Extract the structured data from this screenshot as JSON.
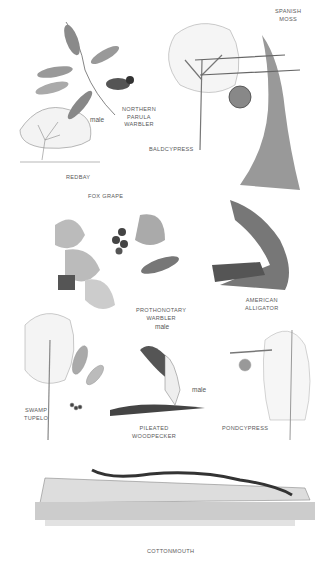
{
  "plate": {
    "labels": {
      "spanish_moss": [
        "SPANISH",
        "MOSS"
      ],
      "northern_parula": [
        "NORTHERN",
        "PARULA",
        "WARBLER"
      ],
      "northern_parula_sex": "male",
      "baldcypress": "BALDCYPRESS",
      "redbay": "REDBAY",
      "fox_grape": "FOX GRAPE",
      "american_alligator": [
        "AMERICAN",
        "ALLIGATOR"
      ],
      "prothonotary": [
        "PROTHONOTARY",
        "WARBLER"
      ],
      "prothonotary_sex": "male",
      "swamp_tupelo": [
        "SWAMP",
        "TUPELO"
      ],
      "pileated_woodpecker": [
        "PILEATED",
        "WOODPECKER"
      ],
      "pileated_sex": "male",
      "pondcypress": "PONDCYPRESS",
      "cottonmouth": "COTTONMOUTH"
    },
    "colors": {
      "ink": "#555555",
      "background": "#ffffff",
      "dark": "#333333"
    }
  }
}
